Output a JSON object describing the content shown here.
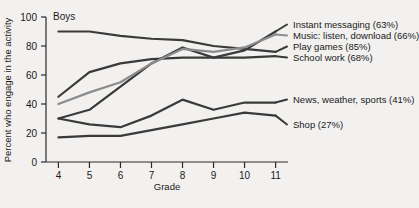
{
  "chart_data": {
    "type": "line",
    "title": "Boys",
    "xlabel": "Grade",
    "ylabel": "Percent who engage in the activity",
    "xlim": [
      3.6,
      11.4
    ],
    "ylim": [
      0,
      100
    ],
    "xticks": [
      4,
      5,
      6,
      7,
      8,
      9,
      10,
      11
    ],
    "yticks": [
      0,
      20,
      40,
      60,
      80,
      100
    ],
    "grid": false,
    "legend_position": "right",
    "x": [
      4,
      5,
      6,
      7,
      8,
      9,
      10,
      11
    ],
    "series": [
      {
        "name": "Play games (85%)",
        "label": "Play games",
        "overall": "85%",
        "color": "#3a3a3a",
        "values": [
          90,
          90,
          87,
          85,
          84,
          80,
          78,
          76
        ]
      },
      {
        "name": "School work (68%)",
        "label": "School work",
        "overall": "68%",
        "color": "#3a3a3a",
        "values": [
          45,
          62,
          68,
          71,
          72,
          72,
          72,
          73
        ]
      },
      {
        "name": "Instant messaging (63%)",
        "label": "Instant messaging",
        "overall": "63%",
        "color": "#3a3a3a",
        "values": [
          30,
          36,
          52,
          68,
          79,
          72,
          77,
          90
        ]
      },
      {
        "name": "Music: listen, download (66%)",
        "label": "Music: listen, download",
        "overall": "66%",
        "color": "#8c8c8c",
        "values": [
          40,
          48,
          55,
          68,
          78,
          76,
          79,
          88
        ]
      },
      {
        "name": "News, weather, sports (41%)",
        "label": "News, weather, sports",
        "overall": "41%",
        "color": "#3a3a3a",
        "values": [
          30,
          26,
          24,
          32,
          43,
          36,
          41,
          41
        ]
      },
      {
        "name": "Shop (27%)",
        "label": "Shop",
        "overall": "27%",
        "color": "#3a3a3a",
        "values": [
          17,
          18,
          18,
          22,
          26,
          30,
          34,
          32
        ]
      }
    ],
    "legend_entries": [
      {
        "text": "Instant messaging (63%)",
        "color": "#3a3a3a"
      },
      {
        "text": "Music: listen, download (66%)",
        "color": "#8c8c8c"
      },
      {
        "text": "Play games (85%)",
        "color": "#3a3a3a"
      },
      {
        "text": "School work (68%)",
        "color": "#3a3a3a"
      },
      {
        "text": "News, weather, sports (41%)",
        "color": "#3a3a3a"
      },
      {
        "text": "Shop (27%)",
        "color": "#3a3a3a"
      }
    ],
    "tick_labels_y": [
      "0",
      "20",
      "40",
      "60",
      "80",
      "100"
    ],
    "tick_labels_x": [
      "4",
      "5",
      "6",
      "7",
      "8",
      "9",
      "10",
      "11"
    ]
  }
}
